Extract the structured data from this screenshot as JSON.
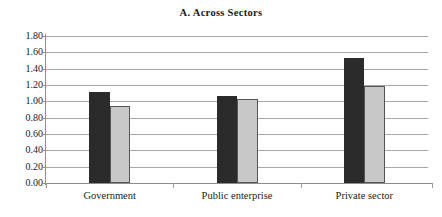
{
  "chart_data": {
    "type": "bar",
    "title": "A. Across Sectors",
    "xlabel": "",
    "ylabel": "",
    "categories": [
      "Government",
      "Public enterprise",
      "Private sector"
    ],
    "series": [
      {
        "name": "series-1",
        "color": "#2b2b2b",
        "values": [
          1.12,
          1.06,
          1.53
        ]
      },
      {
        "name": "series-2",
        "color": "#c8c8c8",
        "values": [
          0.94,
          1.03,
          1.19
        ]
      }
    ],
    "ylim": [
      0.0,
      1.8
    ],
    "ytick_labels": [
      "1.80",
      "1.60",
      "1.40",
      "1.20",
      "1.00",
      "0.80",
      "0.60",
      "0.40",
      "0.20",
      "0.00"
    ],
    "ytick_values": [
      1.8,
      1.6,
      1.4,
      1.2,
      1.0,
      0.8,
      0.6,
      0.4,
      0.2,
      0.0
    ],
    "grid": true,
    "legend": "none"
  }
}
